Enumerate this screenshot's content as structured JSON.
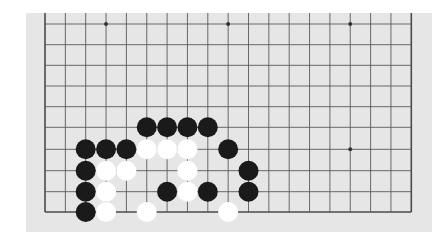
{
  "board": {
    "description": "19x19 Go board, bottom-left portion visible (top rows cropped)",
    "columns": 19,
    "visible_rows": 10,
    "colors": {
      "background": "#e6e6e6",
      "line": "#5a5a5a",
      "edge_line": "#4a4a4a",
      "black_stone": "#1a1a1a",
      "white_stone": "#ffffff"
    },
    "star_points": [
      {
        "col": 3,
        "row": 0
      },
      {
        "col": 9,
        "row": 0
      },
      {
        "col": 15,
        "row": 0
      },
      {
        "col": 15,
        "row": 6
      }
    ],
    "stones": [
      {
        "color": "black",
        "col": 5,
        "row": 5
      },
      {
        "color": "black",
        "col": 6,
        "row": 5
      },
      {
        "color": "black",
        "col": 7,
        "row": 5
      },
      {
        "color": "black",
        "col": 8,
        "row": 5
      },
      {
        "color": "black",
        "col": 2,
        "row": 6
      },
      {
        "color": "black",
        "col": 3,
        "row": 6
      },
      {
        "color": "black",
        "col": 4,
        "row": 6
      },
      {
        "color": "white",
        "col": 5,
        "row": 6
      },
      {
        "color": "white",
        "col": 6,
        "row": 6
      },
      {
        "color": "white",
        "col": 7,
        "row": 6
      },
      {
        "color": "black",
        "col": 9,
        "row": 6
      },
      {
        "color": "black",
        "col": 2,
        "row": 7
      },
      {
        "color": "white",
        "col": 3,
        "row": 7
      },
      {
        "color": "white",
        "col": 4,
        "row": 7
      },
      {
        "color": "white",
        "col": 7,
        "row": 7
      },
      {
        "color": "black",
        "col": 10,
        "row": 7
      },
      {
        "color": "black",
        "col": 2,
        "row": 8
      },
      {
        "color": "white",
        "col": 3,
        "row": 8
      },
      {
        "color": "black",
        "col": 6,
        "row": 8
      },
      {
        "color": "white",
        "col": 7,
        "row": 8
      },
      {
        "color": "black",
        "col": 8,
        "row": 8
      },
      {
        "color": "black",
        "col": 10,
        "row": 8
      },
      {
        "color": "black",
        "col": 2,
        "row": 9
      },
      {
        "color": "white",
        "col": 3,
        "row": 9
      },
      {
        "color": "white",
        "col": 5,
        "row": 9
      },
      {
        "color": "white",
        "col": 9,
        "row": 9
      }
    ]
  }
}
